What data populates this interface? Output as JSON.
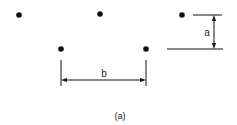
{
  "diagram": {
    "caption": "(a)",
    "dimension_a_label": "a",
    "dimension_b_label": "b",
    "points": [
      {
        "id": "top-left",
        "x": 19,
        "y": 15
      },
      {
        "id": "top-middle",
        "x": 100,
        "y": 14
      },
      {
        "id": "top-right",
        "x": 182,
        "y": 15
      },
      {
        "id": "bottom-left",
        "x": 61,
        "y": 49
      },
      {
        "id": "bottom-right",
        "x": 146,
        "y": 49
      }
    ],
    "colors": {
      "ink": "#111111",
      "background": "#ffffff"
    }
  }
}
